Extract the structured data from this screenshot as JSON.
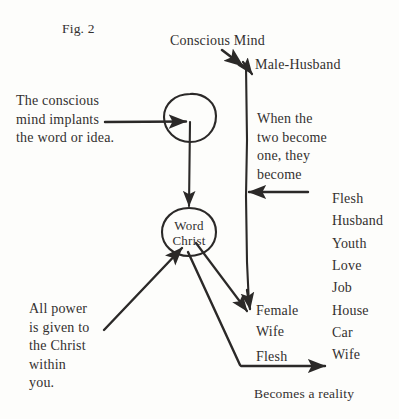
{
  "figure": {
    "title": "Fig. 2",
    "ink_color": "#2b2928",
    "background_color": "#fdfdfb"
  },
  "notes": {
    "conscious_note": "The conscious\nmind implants\nthe word or idea.",
    "union_note": "When the\ntwo become\none, they\nbecome",
    "power_note": "All power\nis given to\nthe Christ\nwithin\nyou."
  },
  "nodes": {
    "conscious_circle_label": "",
    "word_circle": {
      "line1": "Word",
      "line2": "Christ"
    }
  },
  "labels": {
    "conscious_mind": "Conscious Mind",
    "male_husband": "Male-Husband",
    "female": "Female",
    "wife": "Wife",
    "flesh_lower": "Flesh",
    "becomes_reality": "Becomes a reality"
  },
  "outcome_list": {
    "items": [
      "Flesh",
      "Husband",
      "Youth",
      "Love",
      "Job",
      "House",
      "Car",
      "Wife"
    ]
  }
}
